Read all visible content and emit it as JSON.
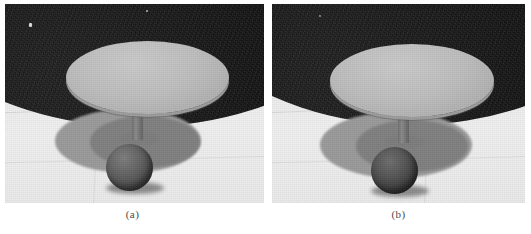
{
  "figure": {
    "type": "two-panel-comparison-figure",
    "panels": [
      {
        "id": "panel-a",
        "caption": "(a)",
        "scene_description": "Rendered grayscale scene: round table with sphere beneath",
        "colors": {
          "backdrop": "#151515",
          "floor": "#eaeaea",
          "tabletop": "#bdbdbd",
          "shadow_outer": "#9a9a9a",
          "shadow_inner": "#808080",
          "sphere": "#565656",
          "stem": "#7a7a7a"
        }
      },
      {
        "id": "panel-b",
        "caption": "(b)",
        "scene_description": "Rendered grayscale scene: round table with sphere beneath, darker sphere",
        "colors": {
          "backdrop": "#151515",
          "floor": "#eaeaea",
          "tabletop": "#bdbdbd",
          "shadow_outer": "#9a9a9a",
          "shadow_inner": "#808080",
          "sphere": "#474747",
          "stem": "#7a7a7a"
        }
      }
    ]
  }
}
